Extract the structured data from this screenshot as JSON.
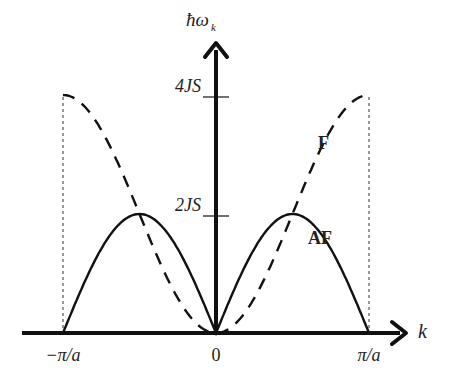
{
  "chart_data": {
    "type": "line",
    "title": "",
    "xlabel": "k",
    "ylabel": "ħω_k",
    "x_ticks": [
      "-π/a",
      "0",
      "π/a"
    ],
    "y_ticks": [
      "2JS",
      "4JS"
    ],
    "xlim": [
      -1,
      1
    ],
    "ylim": [
      0,
      4.4
    ],
    "x_unit": "π/a",
    "y_unit": "JS",
    "series": [
      {
        "name": "F",
        "style": "dashed",
        "formula": "4JS(1-cos(ka))/2 ... reaches 4JS at ±π/a",
        "x": [
          -1,
          -0.75,
          -0.5,
          -0.25,
          0,
          0.25,
          0.5,
          0.75,
          1
        ],
        "y": [
          4,
          3.41,
          2,
          0.59,
          0,
          0.59,
          2,
          3.41,
          4
        ]
      },
      {
        "name": "AF",
        "style": "solid",
        "formula": "2JS|sin(ka)|",
        "x": [
          -1,
          -0.75,
          -0.5,
          -0.25,
          0,
          0.25,
          0.5,
          0.75,
          1
        ],
        "y": [
          0,
          1.41,
          2,
          1.41,
          0,
          1.41,
          2,
          1.41,
          0
        ]
      }
    ],
    "annotations": [
      "F",
      "AF"
    ]
  },
  "labels": {
    "ylabel_main": "ħω",
    "ylabel_sub": "k",
    "xlabel": "k",
    "x_neg": "−π/a",
    "x_zero": "0",
    "x_pos": "π/a",
    "y4": "4JS",
    "y2": "2JS",
    "F": "F",
    "AF": "AF"
  }
}
